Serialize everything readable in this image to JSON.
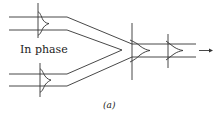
{
  "figure": {
    "label_in_phase": "In phase",
    "caption": "(a)",
    "stroke_color": "#333333",
    "background": "#ffffff",
    "elements": {
      "input_waveguides": [
        "top",
        "bottom"
      ],
      "pulse_profiles": [
        "top-input-pulse",
        "bottom-input-pulse",
        "combined-pulse",
        "output-pulse"
      ],
      "output_arrow": "right-arrow"
    }
  }
}
